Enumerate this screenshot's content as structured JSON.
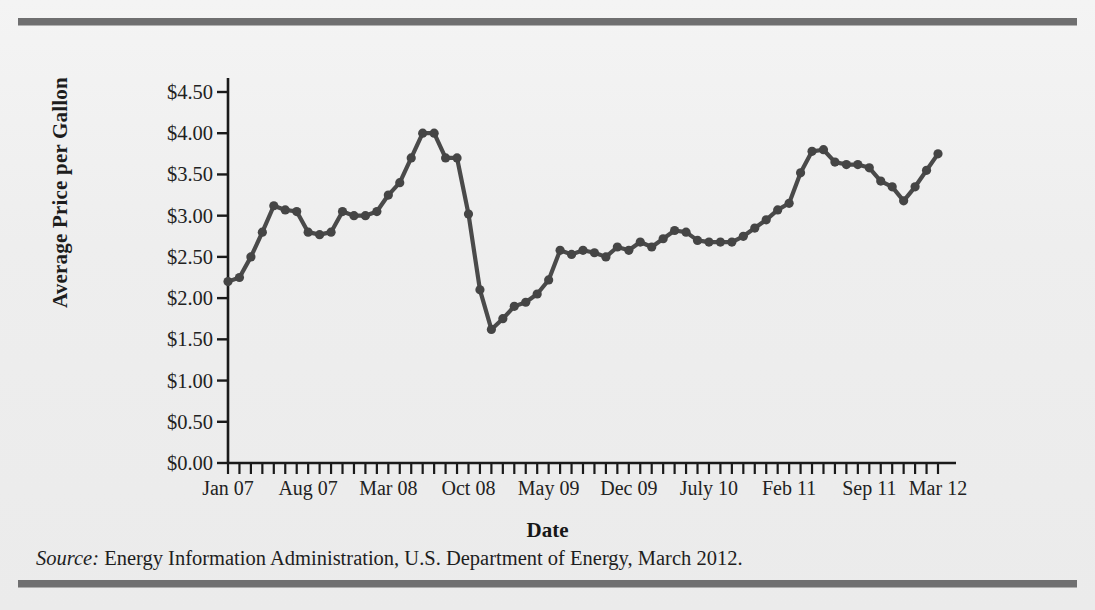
{
  "figure": {
    "y_axis_title": "Average Price per Gallon",
    "x_axis_title": "Date",
    "source_prefix": "Source:",
    "source_text": "Energy Information Administration, U.S. Department of Energy, March 2012."
  },
  "style": {
    "line_color": "#4a4a4a",
    "marker_color": "#454545",
    "axis_color": "#1a1a1a",
    "page_background": "#ececec",
    "rule_color": "#6f6f70"
  },
  "chart_data": {
    "type": "line",
    "title": "",
    "xlabel": "Date",
    "ylabel": "Average Price per Gallon",
    "ylim": [
      0,
      4.5
    ],
    "ytick_labels": [
      "$4.50",
      "$4.00",
      "$3.50",
      "$3.00",
      "$2.50",
      "$2.00",
      "$1.50",
      "$1.00",
      "$0.50",
      "$0.00"
    ],
    "ytick_values": [
      4.5,
      4.0,
      3.5,
      3.0,
      2.5,
      2.0,
      1.5,
      1.0,
      0.5,
      0.0
    ],
    "xtick_labels": [
      "Jan 07",
      "Aug 07",
      "Mar 08",
      "Oct 08",
      "May 09",
      "Dec 09",
      "July 10",
      "Feb 11",
      "Sep 11",
      "Mar 12"
    ],
    "xtick_indices": [
      0,
      7,
      14,
      21,
      28,
      35,
      42,
      49,
      56,
      62
    ],
    "grid": false,
    "legend": false,
    "markers": true,
    "x": [
      "Jan 07",
      "Feb 07",
      "Mar 07",
      "Apr 07",
      "May 07",
      "Jun 07",
      "Jul 07",
      "Aug 07",
      "Sep 07",
      "Oct 07",
      "Nov 07",
      "Dec 07",
      "Jan 08",
      "Feb 08",
      "Mar 08",
      "Apr 08",
      "May 08",
      "Jun 08",
      "Jul 08",
      "Aug 08",
      "Sep 08",
      "Oct 08",
      "Nov 08",
      "Dec 08",
      "Jan 09",
      "Feb 09",
      "Mar 09",
      "Apr 09",
      "May 09",
      "Jun 09",
      "Jul 09",
      "Aug 09",
      "Sep 09",
      "Oct 09",
      "Nov 09",
      "Dec 09",
      "Jan 10",
      "Feb 10",
      "Mar 10",
      "Apr 10",
      "May 10",
      "Jun 10",
      "Jul 10",
      "Aug 10",
      "Sep 10",
      "Oct 10",
      "Nov 10",
      "Dec 10",
      "Jan 11",
      "Feb 11",
      "Mar 11",
      "Apr 11",
      "May 11",
      "Jun 11",
      "Jul 11",
      "Aug 11",
      "Sep 11",
      "Oct 11",
      "Nov 11",
      "Dec 11",
      "Jan 12",
      "Feb 12",
      "Mar 12"
    ],
    "values": [
      2.2,
      2.25,
      2.5,
      2.8,
      3.12,
      3.07,
      3.05,
      2.8,
      2.77,
      2.8,
      3.05,
      3.0,
      3.0,
      3.05,
      3.25,
      3.4,
      3.7,
      4.0,
      4.0,
      3.7,
      3.7,
      3.02,
      2.1,
      1.62,
      1.75,
      1.9,
      1.95,
      2.05,
      2.22,
      2.58,
      2.53,
      2.58,
      2.55,
      2.5,
      2.62,
      2.58,
      2.68,
      2.62,
      2.72,
      2.82,
      2.8,
      2.7,
      2.68,
      2.68,
      2.68,
      2.75,
      2.85,
      2.95,
      3.07,
      3.15,
      3.52,
      3.78,
      3.8,
      3.65,
      3.62,
      3.62,
      3.58,
      3.42,
      3.35,
      3.18,
      3.35,
      3.55,
      3.75
    ]
  }
}
